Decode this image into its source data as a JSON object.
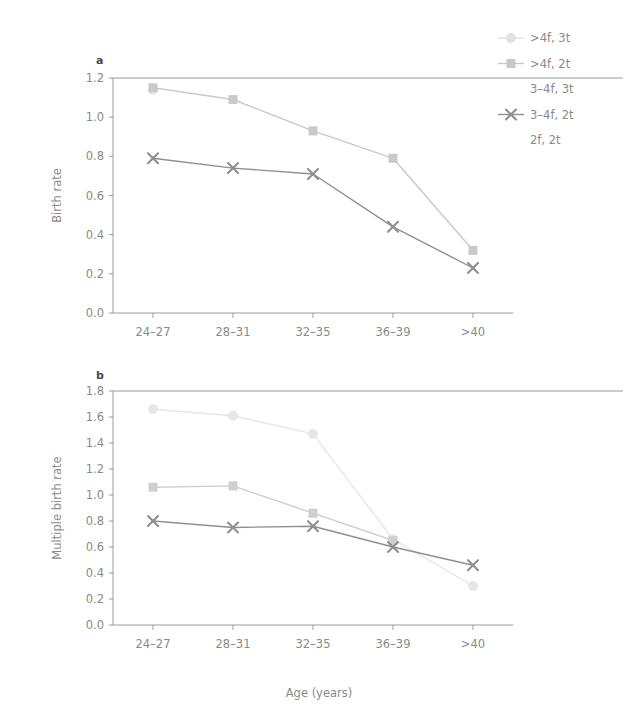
{
  "figure": {
    "xlabel": "Age (years)",
    "panel_a_letter": "a",
    "panel_b_letter": "b"
  },
  "legend": {
    "position": "top-right",
    "entries": [
      {
        "label": ">4f, 3t",
        "marker": "circle",
        "color": "#e2e2e2"
      },
      {
        "label": ">4f, 2t",
        "marker": "square",
        "color": "#c8c8c8"
      },
      {
        "label": "3-4f, 3t",
        "marker": "none",
        "color": "#d8d8d8"
      },
      {
        "label": "3-4f, 2t",
        "marker": "cross",
        "color": "#8f8f8f"
      },
      {
        "label": "2f, 2t",
        "marker": "none",
        "color": "#d0d0d0"
      }
    ]
  },
  "chart_data": [
    {
      "type": "line",
      "panel": "a",
      "title": "a",
      "xlabel": "Age (years)",
      "ylabel": "Birth rate",
      "categories": [
        "24-27",
        "28-31",
        "32-35",
        "36-39",
        ">40"
      ],
      "ylim": [
        0.0,
        1.2
      ],
      "yticks": [
        "0.0",
        "0.2",
        "0.4",
        "0.6",
        "0.8",
        "1.0",
        "1.2"
      ],
      "grid": false,
      "series": [
        {
          "name": ">4f, 3t",
          "marker": "circle",
          "color": "#e6e6e6",
          "values": [
            1.14,
            null,
            null,
            null,
            null
          ]
        },
        {
          "name": ">4f, 2t",
          "marker": "square",
          "color": "#c9c9c9",
          "values": [
            1.15,
            1.09,
            0.93,
            0.79,
            0.32
          ]
        },
        {
          "name": "3-4f, 3t",
          "marker": "none",
          "color": "#dcdcdc",
          "values": [
            null,
            null,
            null,
            null,
            null
          ]
        },
        {
          "name": "3-4f, 2t",
          "marker": "cross",
          "color": "#8f8f8f",
          "values": [
            0.79,
            0.74,
            0.71,
            0.44,
            0.23
          ]
        },
        {
          "name": "2f, 2t",
          "marker": "none",
          "color": "#d4d4d4",
          "values": [
            null,
            null,
            null,
            null,
            null
          ]
        }
      ]
    },
    {
      "type": "line",
      "panel": "b",
      "title": "b",
      "xlabel": "Age (years)",
      "ylabel": "Multiple birth rate",
      "categories": [
        "24-27",
        "28-31",
        "32-35",
        "36-39",
        ">40"
      ],
      "ylim": [
        0.0,
        1.8
      ],
      "yticks": [
        "0.0",
        "0.2",
        "0.4",
        "0.6",
        "0.8",
        "1.0",
        "1.2",
        "1.4",
        "1.6",
        "1.8"
      ],
      "grid": false,
      "series": [
        {
          "name": ">4f, 3t",
          "marker": "circle",
          "color": "#e6e6e6",
          "values": [
            1.66,
            1.61,
            1.47,
            0.66,
            0.3
          ]
        },
        {
          "name": ">4f, 2t",
          "marker": "square",
          "color": "#cfcfcf",
          "values": [
            1.06,
            1.07,
            0.86,
            0.65,
            null
          ]
        },
        {
          "name": "3-4f, 3t",
          "marker": "none",
          "color": "#dcdcdc",
          "values": [
            null,
            null,
            null,
            null,
            null
          ]
        },
        {
          "name": "3-4f, 2t",
          "marker": "cross",
          "color": "#8f8f8f",
          "values": [
            0.8,
            0.75,
            0.76,
            0.6,
            0.46
          ]
        },
        {
          "name": "2f, 2t",
          "marker": "none",
          "color": "#d4d4d4",
          "values": [
            null,
            null,
            null,
            null,
            null
          ]
        }
      ]
    }
  ]
}
